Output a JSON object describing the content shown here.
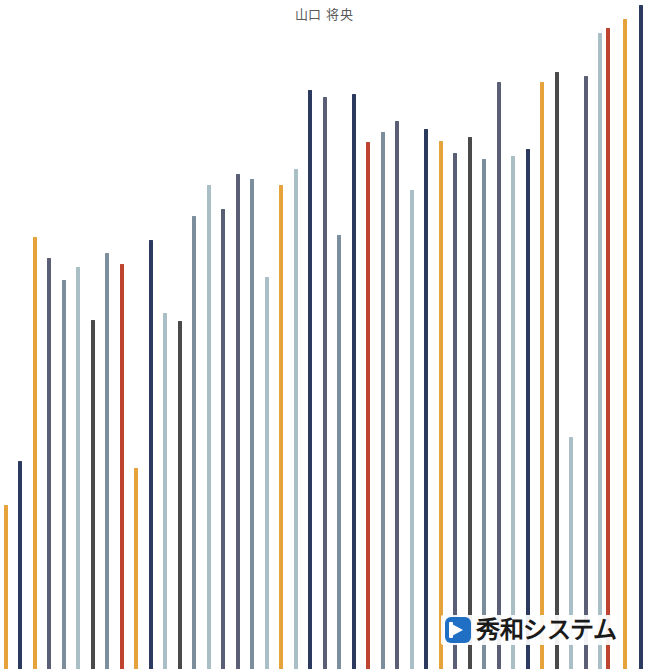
{
  "chart_data": {
    "type": "bar",
    "title": "山口 将央",
    "subtitle": "",
    "xlabel": "",
    "ylabel": "",
    "grid": false,
    "legend": "none",
    "axis_visible": false,
    "ylim": [
      0,
      669
    ],
    "bar_width_px": 4,
    "bar_pitch_px": 14.5,
    "n_bars": 45,
    "palette": {
      "orange": "#E6A33C",
      "navy": "#2B3A5E",
      "dark_gray": "#4A4A4A",
      "slate": "#5B5F75",
      "blue_gray": "#7C8E9B",
      "light_blue_gray": "#A9BEC5",
      "red": "#BF4430"
    },
    "categories": [
      "1",
      "2",
      "3",
      "4",
      "5",
      "6",
      "7",
      "8",
      "9",
      "10",
      "11",
      "12",
      "13",
      "14",
      "15",
      "16",
      "17",
      "18",
      "19",
      "20",
      "21",
      "22",
      "23",
      "24",
      "25",
      "26",
      "27",
      "28",
      "29",
      "30",
      "31",
      "32",
      "33",
      "34",
      "35",
      "36",
      "37",
      "38",
      "39",
      "40",
      "41",
      "42",
      "43",
      "44",
      "45"
    ],
    "values": [
      164,
      208,
      432,
      411,
      389,
      402,
      349,
      416,
      405,
      201,
      429,
      356,
      348,
      453,
      484,
      460,
      495,
      490,
      392,
      484,
      500,
      579,
      572,
      434,
      575,
      527,
      537,
      548,
      479,
      540,
      528,
      516,
      532,
      510,
      587,
      513,
      520,
      587,
      597,
      232,
      593,
      636,
      641,
      650,
      664
    ],
    "bars": [
      {
        "index": 1,
        "x": 4,
        "top": 505,
        "height": 164,
        "color": "#E6A33C",
        "color_name": "orange"
      },
      {
        "index": 2,
        "x": 18,
        "top": 461,
        "height": 208,
        "color": "#2B3A5E",
        "color_name": "navy"
      },
      {
        "index": 3,
        "x": 33,
        "top": 237,
        "height": 432,
        "color": "#E6A33C",
        "color_name": "orange"
      },
      {
        "index": 4,
        "x": 47,
        "top": 258,
        "height": 411,
        "color": "#5B5F75",
        "color_name": "slate"
      },
      {
        "index": 5,
        "x": 62,
        "top": 280,
        "height": 389,
        "color": "#7C8E9B",
        "color_name": "blue_gray"
      },
      {
        "index": 6,
        "x": 76,
        "top": 267,
        "height": 402,
        "color": "#A9BEC5",
        "color_name": "light_blue_gray"
      },
      {
        "index": 7,
        "x": 91,
        "top": 320,
        "height": 349,
        "color": "#4A4A4A",
        "color_name": "dark_gray"
      },
      {
        "index": 8,
        "x": 105,
        "top": 253,
        "height": 416,
        "color": "#7C8E9B",
        "color_name": "blue_gray"
      },
      {
        "index": 9,
        "x": 120,
        "top": 264,
        "height": 405,
        "color": "#BF4430",
        "color_name": "red"
      },
      {
        "index": 10,
        "x": 134,
        "top": 468,
        "height": 201,
        "color": "#E6A33C",
        "color_name": "orange"
      },
      {
        "index": 11,
        "x": 149,
        "top": 240,
        "height": 429,
        "color": "#2B3A5E",
        "color_name": "navy"
      },
      {
        "index": 12,
        "x": 163,
        "top": 313,
        "height": 356,
        "color": "#A9BEC5",
        "color_name": "light_blue_gray"
      },
      {
        "index": 13,
        "x": 178,
        "top": 321,
        "height": 348,
        "color": "#4A4A4A",
        "color_name": "dark_gray"
      },
      {
        "index": 14,
        "x": 192,
        "top": 216,
        "height": 453,
        "color": "#7C8E9B",
        "color_name": "blue_gray"
      },
      {
        "index": 15,
        "x": 207,
        "top": 185,
        "height": 484,
        "color": "#A9BEC5",
        "color_name": "light_blue_gray"
      },
      {
        "index": 16,
        "x": 221,
        "top": 209,
        "height": 460,
        "color": "#5B5F75",
        "color_name": "slate"
      },
      {
        "index": 17,
        "x": 236,
        "top": 174,
        "height": 495,
        "color": "#5B5F75",
        "color_name": "slate"
      },
      {
        "index": 18,
        "x": 250,
        "top": 179,
        "height": 490,
        "color": "#7C8E9B",
        "color_name": "blue_gray"
      },
      {
        "index": 19,
        "x": 265,
        "top": 277,
        "height": 392,
        "color": "#A9BEC5",
        "color_name": "light_blue_gray"
      },
      {
        "index": 20,
        "x": 279,
        "top": 185,
        "height": 484,
        "color": "#E6A33C",
        "color_name": "orange"
      },
      {
        "index": 21,
        "x": 294,
        "top": 169,
        "height": 500,
        "color": "#A9BEC5",
        "color_name": "light_blue_gray"
      },
      {
        "index": 22,
        "x": 308,
        "top": 90,
        "height": 579,
        "color": "#2B3A5E",
        "color_name": "navy"
      },
      {
        "index": 23,
        "x": 323,
        "top": 97,
        "height": 572,
        "color": "#5B5F75",
        "color_name": "slate"
      },
      {
        "index": 24,
        "x": 337,
        "top": 235,
        "height": 434,
        "color": "#7C8E9B",
        "color_name": "blue_gray"
      },
      {
        "index": 25,
        "x": 352,
        "top": 94,
        "height": 575,
        "color": "#2B3A5E",
        "color_name": "navy"
      },
      {
        "index": 26,
        "x": 366,
        "top": 142,
        "height": 527,
        "color": "#BF4430",
        "color_name": "red"
      },
      {
        "index": 27,
        "x": 381,
        "top": 132,
        "height": 537,
        "color": "#7C8E9B",
        "color_name": "blue_gray"
      },
      {
        "index": 28,
        "x": 395,
        "top": 121,
        "height": 548,
        "color": "#5B5F75",
        "color_name": "slate"
      },
      {
        "index": 29,
        "x": 410,
        "top": 190,
        "height": 479,
        "color": "#A9BEC5",
        "color_name": "light_blue_gray"
      },
      {
        "index": 30,
        "x": 424,
        "top": 129,
        "height": 540,
        "color": "#2B3A5E",
        "color_name": "navy"
      },
      {
        "index": 31,
        "x": 439,
        "top": 141,
        "height": 528,
        "color": "#E6A33C",
        "color_name": "orange"
      },
      {
        "index": 32,
        "x": 453,
        "top": 153,
        "height": 516,
        "color": "#5B5F75",
        "color_name": "slate"
      },
      {
        "index": 33,
        "x": 468,
        "top": 137,
        "height": 532,
        "color": "#4A4A4A",
        "color_name": "dark_gray"
      },
      {
        "index": 34,
        "x": 482,
        "top": 159,
        "height": 510,
        "color": "#7C8E9B",
        "color_name": "blue_gray"
      },
      {
        "index": 35,
        "x": 497,
        "top": 82,
        "height": 587,
        "color": "#5B5F75",
        "color_name": "slate"
      },
      {
        "index": 36,
        "x": 511,
        "top": 156,
        "height": 513,
        "color": "#A9BEC5",
        "color_name": "light_blue_gray"
      },
      {
        "index": 37,
        "x": 526,
        "top": 149,
        "height": 520,
        "color": "#2B3A5E",
        "color_name": "navy"
      },
      {
        "index": 38,
        "x": 540,
        "top": 82,
        "height": 587,
        "color": "#E6A33C",
        "color_name": "orange"
      },
      {
        "index": 39,
        "x": 555,
        "top": 72,
        "height": 597,
        "color": "#4A4A4A",
        "color_name": "dark_gray"
      },
      {
        "index": 40,
        "x": 569,
        "top": 437,
        "height": 232,
        "color": "#A9BEC5",
        "color_name": "light_blue_gray"
      },
      {
        "index": 41,
        "x": 584,
        "top": 76,
        "height": 593,
        "color": "#5B5F75",
        "color_name": "slate"
      },
      {
        "index": 42,
        "x": 598,
        "top": 33,
        "height": 636,
        "color": "#A9BEC5",
        "color_name": "light_blue_gray"
      },
      {
        "index": 43,
        "x": 606,
        "top": 28,
        "height": 641,
        "color": "#BF4430",
        "color_name": "red"
      },
      {
        "index": 44,
        "x": 623,
        "top": 19,
        "height": 650,
        "color": "#E6A33C",
        "color_name": "orange"
      },
      {
        "index": 45,
        "x": 639,
        "top": 5,
        "height": 664,
        "color": "#2B3A5E",
        "color_name": "navy"
      }
    ]
  },
  "logo": {
    "text": "秀和システム",
    "mark_color": "#1f6fc4"
  },
  "background_color": "#FFFFFF"
}
